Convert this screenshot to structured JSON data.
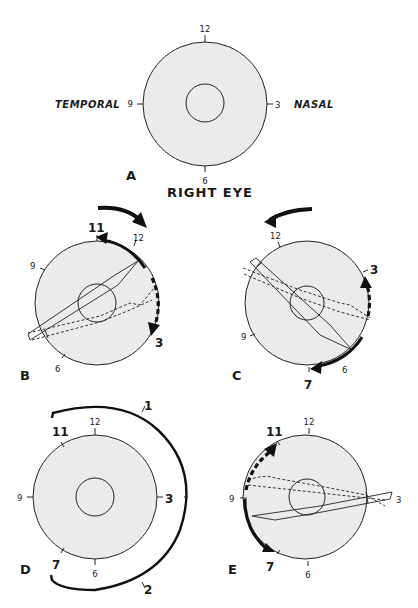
{
  "figure": {
    "title": "RIGHT EYE",
    "side_labels": {
      "left": "TEMPORAL",
      "right": "NASAL"
    },
    "clock_labels": {
      "twelve": "12",
      "three": "3",
      "six": "6",
      "nine": "9",
      "eleven": "11",
      "seven": "7",
      "one": "1",
      "two": "2"
    },
    "panels": {
      "A": {
        "label": "A"
      },
      "B": {
        "label": "B"
      },
      "C": {
        "label": "C"
      },
      "D": {
        "label": "D"
      },
      "E": {
        "label": "E"
      }
    },
    "colors": {
      "disc": "#ebebeb",
      "stroke": "#222222",
      "background": "#ffffff"
    }
  }
}
